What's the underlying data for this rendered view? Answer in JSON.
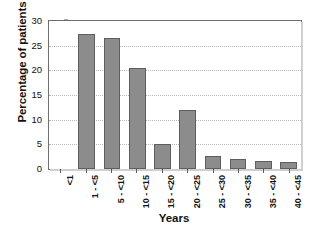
{
  "chart_data": {
    "type": "bar",
    "title": "",
    "xlabel": "Years",
    "ylabel": "Percentage of patients",
    "categories": [
      "<1",
      "1 - <5",
      "5 - <10",
      "10 - <15",
      "15 - <20",
      "20 - <25",
      "25 - <30",
      "30 - <35",
      "35 - <40",
      "40 - <45"
    ],
    "values": [
      0,
      27.3,
      26.6,
      20.5,
      5.1,
      12.0,
      2.7,
      2.1,
      1.7,
      1.4
    ],
    "ylim": [
      0,
      30
    ],
    "yticks": [
      0,
      5,
      10,
      15,
      20,
      25,
      30
    ],
    "ytick_labels": [
      "0",
      "5",
      "10",
      "15",
      "20",
      "25",
      "30"
    ],
    "grid": true,
    "grid_axis": "y",
    "legend": false,
    "legend_position": "none",
    "bar_color": "#8c8c8c",
    "bar_edge_color": "#5e5e5e",
    "grid_color": "#b9b9b9",
    "axis_color": "#6e6e6e",
    "text_color": "#111111",
    "background": "#ffffff"
  }
}
